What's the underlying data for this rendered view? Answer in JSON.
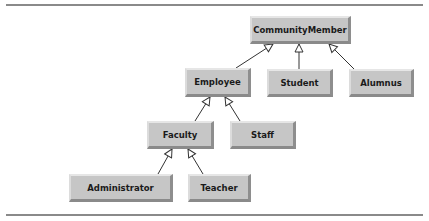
{
  "diagram": {
    "type": "uml-class-inheritance-hierarchy",
    "nodes": {
      "community_member": "CommunityMember",
      "employee": "Employee",
      "student": "Student",
      "alumnus": "Alumnus",
      "faculty": "Faculty",
      "staff": "Staff",
      "administrator": "Administrator",
      "teacher": "Teacher"
    },
    "edges": [
      {
        "from": "Employee",
        "to": "CommunityMember",
        "kind": "generalization"
      },
      {
        "from": "Student",
        "to": "CommunityMember",
        "kind": "generalization"
      },
      {
        "from": "Alumnus",
        "to": "CommunityMember",
        "kind": "generalization"
      },
      {
        "from": "Faculty",
        "to": "Employee",
        "kind": "generalization"
      },
      {
        "from": "Staff",
        "to": "Employee",
        "kind": "generalization"
      },
      {
        "from": "Administrator",
        "to": "Faculty",
        "kind": "generalization"
      },
      {
        "from": "Teacher",
        "to": "Faculty",
        "kind": "generalization"
      }
    ],
    "colors": {
      "node_fill": "#c6c6c6",
      "line": "#333333",
      "rule": "#8a8a8a"
    }
  }
}
